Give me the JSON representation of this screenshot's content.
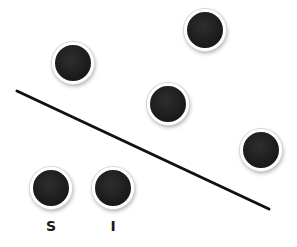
{
  "diagram": {
    "line": {
      "x1": 17,
      "y1": 91,
      "x2": 269,
      "y2": 209,
      "color": "#111111",
      "width": 3
    },
    "dots": [
      {
        "id": "a",
        "cx": 73,
        "cy": 63,
        "label": ""
      },
      {
        "id": "b",
        "cx": 205,
        "cy": 30,
        "label": ""
      },
      {
        "id": "c",
        "cx": 168,
        "cy": 104,
        "label": ""
      },
      {
        "id": "d",
        "cx": 261,
        "cy": 150,
        "label": ""
      },
      {
        "id": "s",
        "cx": 51,
        "cy": 188,
        "label": "S"
      },
      {
        "id": "i",
        "cx": 113,
        "cy": 188,
        "label": "I"
      }
    ],
    "labels": [
      {
        "text": "S",
        "x": 51,
        "y": 226
      },
      {
        "text": "I",
        "x": 113,
        "y": 226
      }
    ],
    "colors": {
      "dot": "#1c1c1c",
      "ring": "#ffffff",
      "background": "#ffffff",
      "line": "#111111"
    }
  }
}
